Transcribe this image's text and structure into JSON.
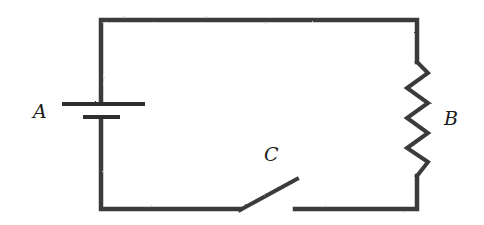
{
  "diagram": {
    "type": "circuit-schematic",
    "components": [
      {
        "id": "A",
        "label": "A",
        "kind": "battery"
      },
      {
        "id": "B",
        "label": "B",
        "kind": "resistor"
      },
      {
        "id": "C",
        "label": "C",
        "kind": "switch",
        "state": "open"
      }
    ],
    "colors": {
      "wire": "#3a3a3a",
      "label": "#1a1a1a",
      "background": "#ffffff"
    }
  }
}
